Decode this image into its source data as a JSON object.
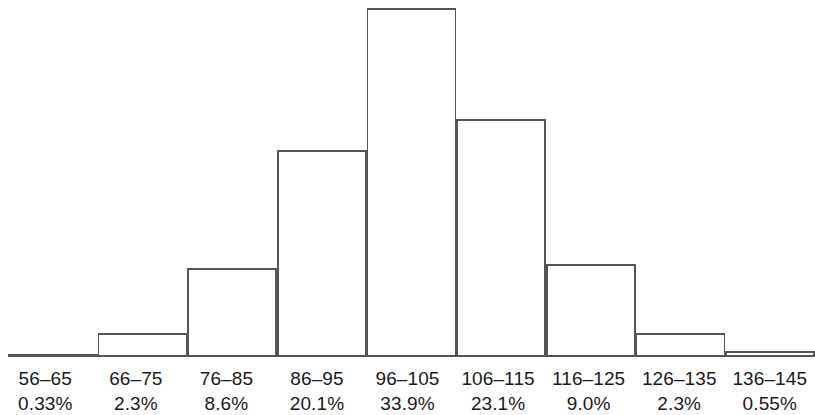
{
  "chart_data": {
    "type": "bar",
    "title": "",
    "subtitle": "",
    "xlabel": "",
    "ylabel": "",
    "grid": false,
    "legend": false,
    "axis_line": false,
    "baseline_visible": true,
    "categories": [
      "56–65",
      "66–75",
      "76–85",
      "86–95",
      "96–105",
      "106–115",
      "116–125",
      "126–135",
      "136–145"
    ],
    "values": [
      0.33,
      2.3,
      8.6,
      20.1,
      33.9,
      23.1,
      9.0,
      2.3,
      0.55
    ],
    "value_labels": [
      "0.33%",
      "2.3%",
      "8.6%",
      "20.1%",
      "33.9%",
      "23.1%",
      "9.0%",
      "2.3%",
      "0.55%"
    ],
    "ylim": [
      0,
      34.5
    ],
    "units": "percent",
    "bar_fill": "#ffffff",
    "bar_stroke": "#555555",
    "bar_stroke_width": 1.6,
    "text_color": "#1a1a1a"
  },
  "bins": [
    {
      "range": "56–65",
      "pct": "0.33%"
    },
    {
      "range": "66–75",
      "pct": "2.3%"
    },
    {
      "range": "76–85",
      "pct": "8.6%"
    },
    {
      "range": "86–95",
      "pct": "20.1%"
    },
    {
      "range": "96–105",
      "pct": "33.9%"
    },
    {
      "range": "106–115",
      "pct": "23.1%"
    },
    {
      "range": "116–125",
      "pct": "9.0%"
    },
    {
      "range": "126–135",
      "pct": "2.3%"
    },
    {
      "range": "136–145",
      "pct": "0.55%"
    }
  ]
}
